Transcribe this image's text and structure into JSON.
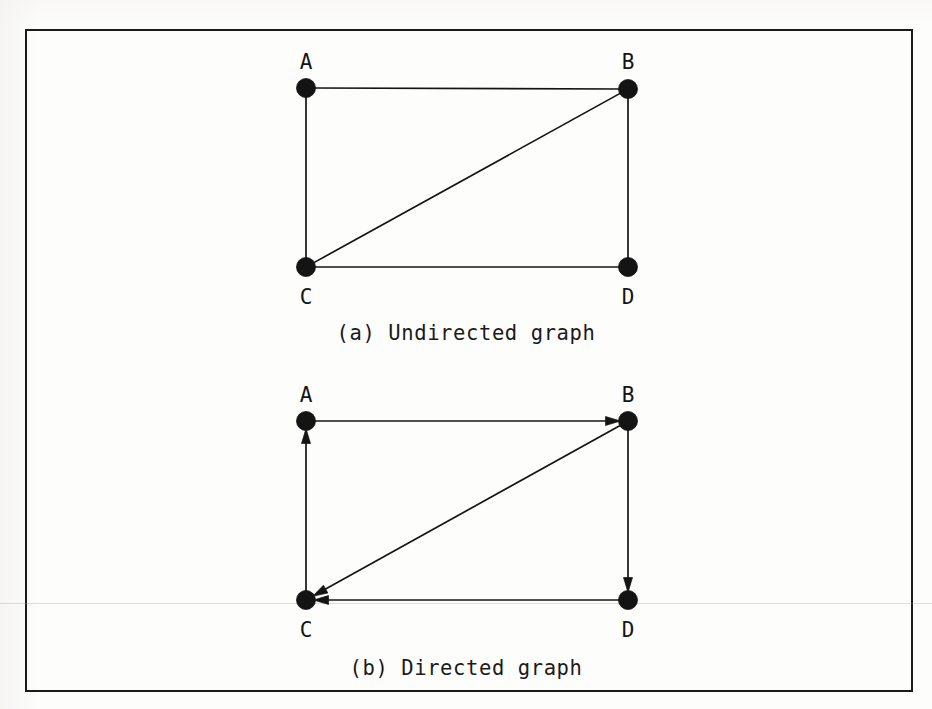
{
  "figure": {
    "frame": {
      "border_color": "#1b1b1b"
    },
    "background_color": "#fdfdfc",
    "ink_color": "#141414"
  },
  "panels": [
    {
      "id": "undirected",
      "caption": "(a) Undirected graph",
      "type": "undirected",
      "nodes": [
        {
          "id": "A",
          "label": "A",
          "x": 306,
          "y": 88,
          "label_x": 306,
          "label_y": 52
        },
        {
          "id": "B",
          "label": "B",
          "x": 628,
          "y": 89,
          "label_x": 628,
          "label_y": 52
        },
        {
          "id": "C",
          "label": "C",
          "x": 306,
          "y": 267,
          "label_x": 306,
          "label_y": 287
        },
        {
          "id": "D",
          "label": "D",
          "x": 628,
          "y": 267,
          "label_x": 628,
          "label_y": 287
        }
      ],
      "edges": [
        {
          "from": "A",
          "to": "B",
          "directed": false
        },
        {
          "from": "A",
          "to": "C",
          "directed": false
        },
        {
          "from": "C",
          "to": "D",
          "directed": false
        },
        {
          "from": "B",
          "to": "D",
          "directed": false
        },
        {
          "from": "C",
          "to": "B",
          "directed": false
        }
      ],
      "caption_x": 466,
      "caption_y": 323
    },
    {
      "id": "directed",
      "caption": "(b) Directed graph",
      "type": "directed",
      "nodes": [
        {
          "id": "A",
          "label": "A",
          "x": 306,
          "y": 421,
          "label_x": 306,
          "label_y": 385
        },
        {
          "id": "B",
          "label": "B",
          "x": 628,
          "y": 421,
          "label_x": 628,
          "label_y": 385
        },
        {
          "id": "C",
          "label": "C",
          "x": 306,
          "y": 600,
          "label_x": 306,
          "label_y": 620
        },
        {
          "id": "D",
          "label": "D",
          "x": 628,
          "y": 600,
          "label_x": 628,
          "label_y": 620
        }
      ],
      "edges": [
        {
          "from": "A",
          "to": "B",
          "directed": true
        },
        {
          "from": "C",
          "to": "A",
          "directed": true
        },
        {
          "from": "B",
          "to": "D",
          "directed": true
        },
        {
          "from": "D",
          "to": "C",
          "directed": true
        },
        {
          "from": "B",
          "to": "C",
          "directed": true
        }
      ],
      "caption_x": 466,
      "caption_y": 658
    }
  ],
  "style": {
    "node_radius": 9.5,
    "edge_width": 1.7,
    "arrow_length": 15,
    "arrow_half_width": 4.5
  },
  "artifacts": {
    "scan_streak_y": 603
  }
}
